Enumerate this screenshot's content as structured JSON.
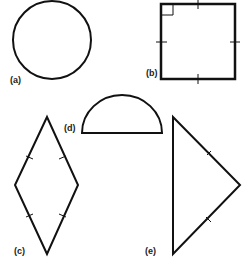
{
  "figure": {
    "stroke_color": "#111111",
    "background": "#ffffff",
    "shapes": [
      {
        "id": "a",
        "label": "(a)",
        "shape": "circle"
      },
      {
        "id": "b",
        "label": "(b)",
        "shape": "square",
        "marks": "right-angle marker, tick marks on all four sides"
      },
      {
        "id": "c",
        "label": "(c)",
        "shape": "rhombus",
        "marks": "tick marks on all four sides"
      },
      {
        "id": "d",
        "label": "(d)",
        "shape": "semicircle"
      },
      {
        "id": "e",
        "label": "(e)",
        "shape": "triangle",
        "marks": "tick marks on two equal sides"
      }
    ]
  }
}
